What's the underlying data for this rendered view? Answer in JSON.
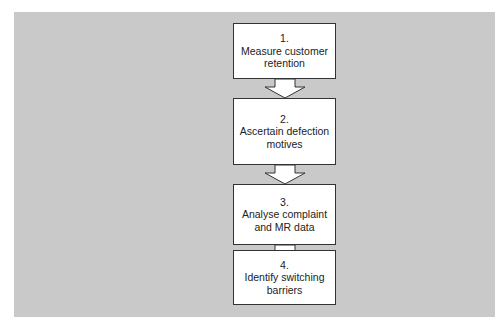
{
  "diagram": {
    "type": "flowchart",
    "direction": "top-to-bottom",
    "colors": {
      "background_panel": "#c9c9c9",
      "box_fill": "#ffffff",
      "box_border": "#333333",
      "text": "#222222"
    },
    "steps": [
      {
        "number": "1.",
        "label": "Measure customer retention"
      },
      {
        "number": "2.",
        "label": "Ascertain defection motives"
      },
      {
        "number": "3.",
        "label": "Analyse complaint and MR data"
      },
      {
        "number": "4.",
        "label": "Identify switching barriers"
      }
    ]
  }
}
